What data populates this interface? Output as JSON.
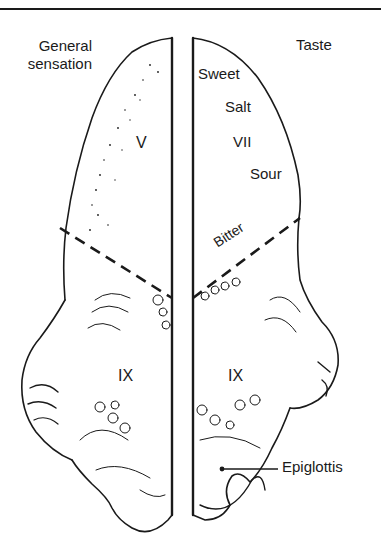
{
  "diagram": {
    "left_half": {
      "heading": "General sensation",
      "heading_lines": [
        "General",
        "sensation"
      ],
      "anterior_region_nerve": "V",
      "posterior_region_nerve": "IX"
    },
    "right_half": {
      "heading": "Taste",
      "anterior_region_nerve": "VII",
      "taste_zones": [
        "Sweet",
        "Salt",
        "Sour"
      ],
      "posterior_taste_zone": "Bitter",
      "posterior_region_nerve": "IX"
    },
    "structures": {
      "epiglottis": "Epiglottis"
    },
    "legend_notes": {
      "boundary_line": "dashed line separating anterior two-thirds from posterior third"
    },
    "colors": {
      "ink": "#1a1a1a",
      "paper": "#ffffff"
    }
  }
}
